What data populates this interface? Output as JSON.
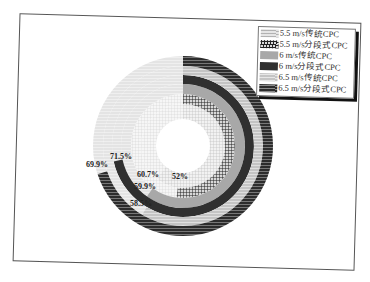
{
  "chart_data": {
    "type": "pie",
    "subtype": "concentric-donut (radial bar)",
    "title": "",
    "series": [
      {
        "name": "5.5 m/s传统CPC",
        "value": 60.7,
        "label": "60.7%",
        "ring": 1,
        "pattern": "fine-grid",
        "color": "#cfcfcf"
      },
      {
        "name": "5.5 m/s分段式CPC",
        "value": 52,
        "label": "52%",
        "ring": 2,
        "pattern": "cross-hatch",
        "color": "#3a3a3a"
      },
      {
        "name": "6 m/s传统CPC",
        "value": 59.9,
        "label": "59.9%",
        "ring": 3,
        "pattern": "solid",
        "color": "#a8a8a8"
      },
      {
        "name": "6 m/s分段式CPC",
        "value": 71.5,
        "label": "71.5%",
        "ring": 4,
        "pattern": "solid",
        "color": "#303030"
      },
      {
        "name": "6.5 m/s传统CPC",
        "value": 58.5,
        "label": "58.5%",
        "ring": 5,
        "pattern": "horizontal-stripes",
        "color": "#bdbdbd"
      },
      {
        "name": "6.5 m/s分段式CPC",
        "value": 69.9,
        "label": "69.9%",
        "ring": 6,
        "pattern": "horizontal-stripes",
        "color": "#2e2e2e"
      }
    ],
    "legend_position": "top-right",
    "grid": false,
    "start_angle": "12 o'clock, clockwise"
  },
  "legend": {
    "items": [
      {
        "label": "5.5 m/s传统CPC"
      },
      {
        "label": "5.5 m/s分段式CPC"
      },
      {
        "label": "6 m/s传统CPC"
      },
      {
        "label": "6 m/s分段式CPC"
      },
      {
        "label": "6.5 m/s传统CPC"
      },
      {
        "label": "6.5 m/s分段式CPC"
      }
    ]
  },
  "labels": {
    "l1": "60.7%",
    "l2": "52%",
    "l3": "59.9%",
    "l4": "71.5%",
    "l5": "58.5%",
    "l6": "69.9%"
  }
}
